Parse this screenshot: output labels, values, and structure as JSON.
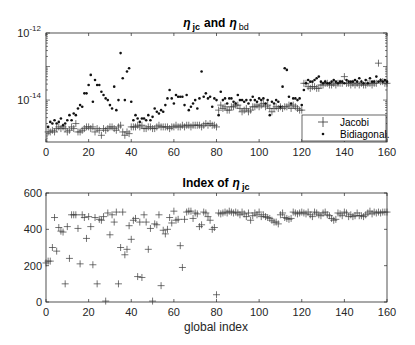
{
  "chart_data": [
    {
      "type": "scatter",
      "title": "η jc and η bd",
      "title_parts": {
        "eta1": "η",
        "sub1": "jc",
        "and": "and",
        "eta2": "η",
        "sub2": "bd"
      },
      "xlabel": "",
      "ylabel": "",
      "yscale": "log",
      "xlim": [
        0,
        160
      ],
      "ylim_log10": [
        -15.25,
        -12
      ],
      "xticks": [
        0,
        20,
        40,
        60,
        80,
        100,
        120,
        140,
        160
      ],
      "xtick_labels": [
        "0",
        "20",
        "40",
        "60",
        "80",
        "100",
        "120",
        "140",
        "160"
      ],
      "yticks_log10": [
        -14,
        -12
      ],
      "ytick_labels": [
        {
          "base": "10",
          "exp": "-14"
        },
        {
          "base": "10",
          "exp": "-12"
        }
      ],
      "grid": false,
      "legend": {
        "position": "southeast",
        "entries": [
          {
            "label": "Jacobi",
            "marker": "+"
          },
          {
            "label": "Bidiagonal.",
            "marker": "."
          }
        ]
      },
      "series": [
        {
          "name": "Jacobi",
          "marker": "+",
          "x": [
            1,
            2,
            3,
            4,
            5,
            6,
            7,
            8,
            9,
            10,
            11,
            12,
            13,
            14,
            15,
            16,
            17,
            18,
            19,
            20,
            21,
            22,
            23,
            24,
            25,
            26,
            27,
            28,
            29,
            30,
            31,
            32,
            33,
            34,
            35,
            36,
            37,
            38,
            39,
            40,
            41,
            42,
            43,
            44,
            45,
            46,
            47,
            48,
            49,
            50,
            51,
            52,
            53,
            54,
            55,
            56,
            57,
            58,
            59,
            60,
            61,
            62,
            63,
            64,
            65,
            66,
            67,
            68,
            69,
            70,
            71,
            72,
            73,
            74,
            75,
            76,
            77,
            78,
            79,
            80,
            81,
            82,
            83,
            84,
            85,
            86,
            87,
            88,
            89,
            90,
            91,
            92,
            93,
            94,
            95,
            96,
            97,
            98,
            99,
            100,
            101,
            102,
            103,
            104,
            105,
            106,
            107,
            108,
            109,
            110,
            111,
            112,
            113,
            114,
            115,
            116,
            117,
            118,
            119,
            120,
            121,
            122,
            123,
            124,
            125,
            126,
            127,
            128,
            129,
            130,
            131,
            132,
            133,
            134,
            135,
            136,
            137,
            138,
            139,
            140,
            141,
            142,
            143,
            144,
            145,
            146,
            147,
            148,
            149,
            150,
            151,
            152,
            153,
            154,
            155,
            156,
            157,
            158,
            159,
            160
          ],
          "log10_values": [
            -14.95,
            -14.95,
            -14.9,
            -14.95,
            -14.85,
            -14.8,
            -14.85,
            -14.8,
            -14.85,
            -14.95,
            -14.9,
            -14.8,
            -14.85,
            -14.7,
            -14.95,
            -14.95,
            -14.9,
            -14.85,
            -14.8,
            -14.8,
            -14.85,
            -14.8,
            -14.95,
            -14.85,
            -14.9,
            -15.05,
            -14.85,
            -14.9,
            -14.85,
            -14.8,
            -14.8,
            -14.85,
            -14.9,
            -14.8,
            -14.75,
            -14.95,
            -15.05,
            -14.95,
            -15.0,
            -14.8,
            -14.8,
            -14.8,
            -14.75,
            -14.8,
            -14.75,
            -14.85,
            -14.85,
            -14.8,
            -14.8,
            -14.85,
            -14.85,
            -14.8,
            -14.75,
            -14.8,
            -14.8,
            -14.8,
            -14.8,
            -14.85,
            -14.8,
            -14.8,
            -14.75,
            -14.8,
            -14.8,
            -14.75,
            -14.8,
            -14.75,
            -14.75,
            -14.8,
            -14.75,
            -14.75,
            -14.75,
            -14.75,
            -14.8,
            -14.75,
            -14.7,
            -14.75,
            -14.7,
            -14.75,
            -14.75,
            -14.8,
            -14.3,
            -14.15,
            -14.25,
            -14.2,
            -14.3,
            -14.3,
            -14.2,
            -14.2,
            -14.15,
            -14.15,
            -14.25,
            -14.35,
            -14.3,
            -14.25,
            -14.35,
            -14.3,
            -14.2,
            -14.2,
            -14.15,
            -14.2,
            -14.15,
            -14.1,
            -14.2,
            -14.15,
            -14.25,
            -14.35,
            -14.25,
            -14.2,
            -14.25,
            -14.2,
            -14.25,
            -14.2,
            -14.2,
            -14.15,
            -14.25,
            -14.15,
            -14.2,
            -14.25,
            -14.3,
            -14.3,
            -13.5,
            -13.5,
            -13.6,
            -13.65,
            -13.6,
            -13.6,
            -13.65,
            -13.65,
            -13.55,
            -13.55,
            -13.5,
            -13.5,
            -13.55,
            -13.55,
            -13.5,
            -13.55,
            -13.5,
            -13.5,
            -13.5,
            -13.3,
            -13.5,
            -13.5,
            -13.55,
            -13.5,
            -13.55,
            -13.5,
            -13.55,
            -13.5,
            -13.55,
            -13.55,
            -13.5,
            -13.5,
            -13.55,
            -13.5,
            -13.5,
            -12.9,
            -13.45,
            -13.45,
            -13.5,
            -13.5
          ]
        },
        {
          "name": "Bidiagonal.",
          "marker": ".",
          "x": [
            1,
            2,
            3,
            4,
            5,
            6,
            7,
            8,
            9,
            10,
            11,
            12,
            13,
            14,
            15,
            16,
            17,
            18,
            19,
            20,
            21,
            22,
            23,
            24,
            25,
            26,
            27,
            28,
            29,
            30,
            31,
            32,
            33,
            34,
            35,
            36,
            37,
            38,
            39,
            40,
            41,
            42,
            43,
            44,
            45,
            46,
            47,
            48,
            49,
            50,
            51,
            52,
            53,
            54,
            55,
            56,
            57,
            58,
            59,
            60,
            61,
            62,
            63,
            64,
            65,
            66,
            67,
            68,
            69,
            70,
            71,
            72,
            73,
            74,
            75,
            76,
            77,
            78,
            79,
            80,
            81,
            82,
            83,
            84,
            85,
            86,
            87,
            88,
            89,
            90,
            91,
            92,
            93,
            94,
            95,
            96,
            97,
            98,
            99,
            100,
            101,
            102,
            103,
            104,
            105,
            106,
            107,
            108,
            109,
            110,
            111,
            112,
            113,
            114,
            115,
            116,
            117,
            118,
            119,
            120,
            121,
            122,
            123,
            124,
            125,
            126,
            127,
            128,
            129,
            130,
            131,
            132,
            133,
            134,
            135,
            136,
            137,
            138,
            139,
            140,
            141,
            142,
            143,
            144,
            145,
            146,
            147,
            148,
            149,
            150,
            151,
            152,
            153,
            154,
            155,
            156,
            157,
            158,
            159,
            160
          ],
          "log10_values": [
            -14.8,
            -14.65,
            -14.7,
            -14.6,
            -14.7,
            -14.65,
            -14.55,
            -14.75,
            -14.7,
            -14.6,
            -14.45,
            -14.6,
            -14.4,
            -14.45,
            -14.25,
            -14.15,
            -14.2,
            -13.8,
            -13.8,
            -13.55,
            -13.25,
            -14.05,
            -13.4,
            -13.55,
            -13.55,
            -13.75,
            -13.85,
            -13.95,
            -14.0,
            -14.15,
            -14.25,
            -13.6,
            -14.3,
            -14.0,
            -12.6,
            -13.35,
            -14.0,
            -13.15,
            -13.05,
            -14.05,
            -14.6,
            -14.45,
            -14.55,
            -14.65,
            -14.55,
            -14.55,
            -14.6,
            -14.45,
            -14.6,
            -14.5,
            -14.25,
            -14.35,
            -14.4,
            -14.3,
            -14.35,
            -14.15,
            -13.95,
            -13.7,
            -13.95,
            -14.1,
            -13.85,
            -13.9,
            -13.9,
            -13.9,
            -14.15,
            -13.85,
            -14.3,
            -14.2,
            -14.1,
            -14.0,
            -14.25,
            -13.95,
            -13.15,
            -13.9,
            -13.8,
            -13.95,
            -13.9,
            -14.2,
            -13.95,
            -14.0,
            -14.45,
            -13.75,
            -14.0,
            -13.95,
            -14.1,
            -13.95,
            -13.95,
            -14.05,
            -14.1,
            -13.85,
            -14.0,
            -14.0,
            -14.05,
            -14.0,
            -14.1,
            -14.0,
            -13.9,
            -14.0,
            -14.05,
            -13.95,
            -14.0,
            -13.95,
            -14.1,
            -14.0,
            -14.45,
            -14.05,
            -14.1,
            -14.0,
            -14.05,
            -14.2,
            -13.6,
            -13.05,
            -13.1,
            -13.9,
            -14.1,
            -13.95,
            -13.95,
            -14.0,
            -13.95,
            -14.15,
            -13.7,
            -13.5,
            -13.4,
            -13.45,
            -13.45,
            -13.4,
            -13.35,
            -13.3,
            -13.45,
            -13.5,
            -13.45,
            -13.5,
            -13.5,
            -13.45,
            -13.4,
            -13.45,
            -13.5,
            -13.45,
            -13.45,
            -13.5,
            -13.4,
            -13.45,
            -13.45,
            -13.45,
            -13.4,
            -13.45,
            -13.35,
            -13.45,
            -13.5,
            -13.4,
            -13.5,
            -13.35,
            -13.45,
            -13.45,
            -13.3,
            -13.45,
            -13.4,
            -13.45,
            -13.4,
            -13.45
          ]
        }
      ]
    },
    {
      "type": "scatter",
      "title": "Index of η jc",
      "title_parts": {
        "prefix": "Index of",
        "eta": "η",
        "sub": "jc"
      },
      "xlabel": "global index",
      "ylabel": "",
      "xlim": [
        0,
        160
      ],
      "ylim": [
        0,
        600
      ],
      "xticks": [
        0,
        20,
        40,
        60,
        80,
        100,
        120,
        140,
        160
      ],
      "xtick_labels": [
        "0",
        "20",
        "40",
        "60",
        "80",
        "100",
        "120",
        "140",
        "160"
      ],
      "yticks": [
        0,
        200,
        400,
        600
      ],
      "ytick_labels": [
        "0",
        "200",
        "400",
        "600"
      ],
      "grid": false,
      "series": [
        {
          "name": "Index of eta_jc",
          "marker": "+",
          "x": [
            0,
            1,
            2,
            3,
            4,
            5,
            6,
            7,
            8,
            9,
            10,
            11,
            12,
            13,
            14,
            15,
            16,
            17,
            18,
            19,
            20,
            21,
            22,
            23,
            24,
            25,
            26,
            27,
            28,
            29,
            30,
            31,
            32,
            33,
            34,
            35,
            36,
            37,
            38,
            39,
            40,
            41,
            42,
            43,
            44,
            45,
            46,
            47,
            48,
            49,
            50,
            51,
            52,
            53,
            54,
            55,
            56,
            57,
            58,
            59,
            60,
            61,
            62,
            63,
            64,
            65,
            66,
            67,
            68,
            69,
            70,
            71,
            72,
            73,
            74,
            75,
            76,
            77,
            78,
            79,
            80,
            81,
            82,
            83,
            84,
            85,
            86,
            87,
            88,
            89,
            90,
            91,
            92,
            93,
            94,
            95,
            96,
            97,
            98,
            99,
            100,
            101,
            102,
            103,
            104,
            105,
            106,
            107,
            108,
            109,
            110,
            111,
            112,
            113,
            114,
            115,
            116,
            117,
            118,
            119,
            120,
            121,
            122,
            123,
            124,
            125,
            126,
            127,
            128,
            129,
            130,
            131,
            132,
            133,
            134,
            135,
            136,
            137,
            138,
            139,
            140,
            141,
            142,
            143,
            144,
            145,
            146,
            147,
            148,
            149,
            150,
            151,
            152,
            153,
            154,
            155,
            156,
            157,
            158,
            159,
            160
          ],
          "values": [
            215,
            225,
            225,
            300,
            465,
            280,
            410,
            390,
            385,
            100,
            415,
            240,
            480,
            480,
            480,
            405,
            210,
            480,
            465,
            350,
            470,
            415,
            205,
            465,
            100,
            455,
            450,
            470,
            5,
            490,
            370,
            480,
            440,
            495,
            100,
            300,
            495,
            260,
            290,
            420,
            345,
            450,
            460,
            140,
            440,
            135,
            480,
            440,
            290,
            405,
            5,
            430,
            425,
            480,
            90,
            395,
            375,
            400,
            465,
            435,
            500,
            450,
            455,
            310,
            190,
            455,
            495,
            500,
            500,
            460,
            490,
            485,
            415,
            425,
            495,
            490,
            470,
            450,
            400,
            410,
            40,
            490,
            485,
            490,
            495,
            490,
            500,
            495,
            490,
            495,
            490,
            480,
            495,
            485,
            470,
            490,
            450,
            475,
            490,
            480,
            495,
            470,
            480,
            470,
            465,
            460,
            450,
            440,
            440,
            430,
            480,
            490,
            465,
            460,
            455,
            460,
            495,
            490,
            485,
            490,
            495,
            490,
            485,
            495,
            480,
            470,
            495,
            490,
            480,
            475,
            490,
            495,
            480,
            475,
            460,
            450,
            455,
            490,
            485,
            475,
            495,
            490,
            470,
            480,
            470,
            475,
            490,
            475,
            475,
            470,
            480,
            490,
            500,
            485,
            495,
            490,
            495,
            490,
            495,
            495,
            495
          ]
        }
      ]
    }
  ]
}
